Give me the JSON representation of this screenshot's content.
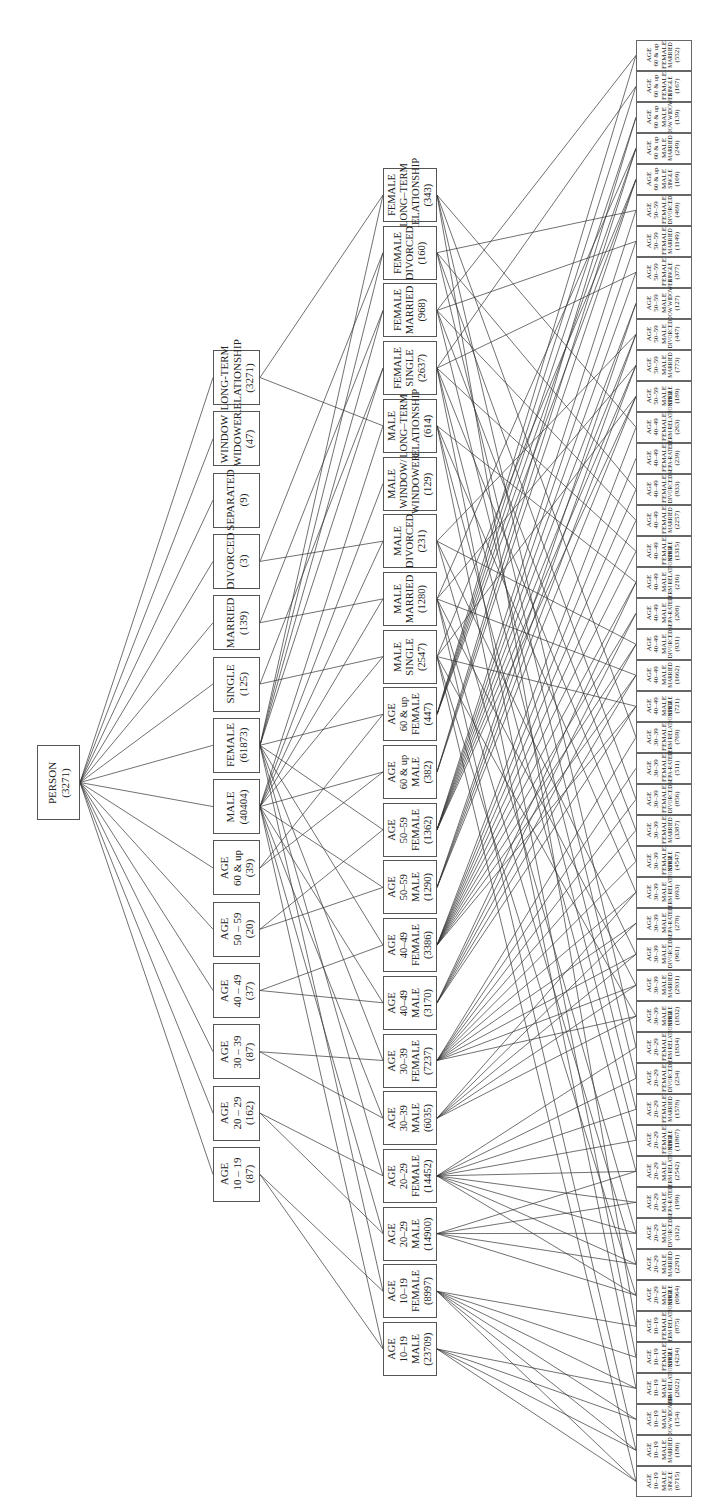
{
  "root": {
    "label": "PERSON",
    "count": "(3271)"
  },
  "level2": [
    {
      "lines": [
        "LONG-TERM",
        "RELATIONSHIP"
      ],
      "count": "(3271)"
    },
    {
      "lines": [
        "WINDOW",
        "WIDOWER"
      ],
      "count": "(47)"
    },
    {
      "lines": [
        "SEPARATED"
      ],
      "count": "(9)"
    },
    {
      "lines": [
        "DIVORCED"
      ],
      "count": "(3)"
    },
    {
      "lines": [
        "MARRIED"
      ],
      "count": "(139)"
    },
    {
      "lines": [
        "SINGLE"
      ],
      "count": "(125)"
    },
    {
      "lines": [
        "FEMALE"
      ],
      "count": "(61873)"
    },
    {
      "lines": [
        "MALE"
      ],
      "count": "(40404)"
    },
    {
      "lines": [
        "AGE",
        "60 & up"
      ],
      "count": "(39)"
    },
    {
      "lines": [
        "AGE",
        "50 – 59"
      ],
      "count": "(20)"
    },
    {
      "lines": [
        "AGE",
        "40 – 49"
      ],
      "count": "(37)"
    },
    {
      "lines": [
        "AGE",
        "30 – 39"
      ],
      "count": "(87)"
    },
    {
      "lines": [
        "AGE",
        "20 – 29"
      ],
      "count": "(162)"
    },
    {
      "lines": [
        "AGE",
        "10 – 19"
      ],
      "count": "(87)"
    }
  ],
  "level3": [
    {
      "lines": [
        "FEMALE",
        "LONG–TERM",
        "RELATIONSHIP"
      ],
      "count": "(343)"
    },
    {
      "lines": [
        "FEMALE",
        "DIVORCED"
      ],
      "count": "(160)"
    },
    {
      "lines": [
        "FEMALE",
        "MARRIED"
      ],
      "count": "(968)"
    },
    {
      "lines": [
        "FEMALE",
        "SINGLE"
      ],
      "count": "(2637)"
    },
    {
      "lines": [
        "MALE",
        "LONG–TERM",
        "RELATIONSHIP"
      ],
      "count": "(614)"
    },
    {
      "lines": [
        "MALE",
        "WINDOW/",
        "WINDOWER"
      ],
      "count": "(129)"
    },
    {
      "lines": [
        "MALE",
        "DIVORCED"
      ],
      "count": "(231)"
    },
    {
      "lines": [
        "MALE",
        "MARRIED"
      ],
      "count": "(1280)"
    },
    {
      "lines": [
        "MALE",
        "SINGLE"
      ],
      "count": "(2547)"
    },
    {
      "lines": [
        "AGE",
        "60 & up",
        "FEMALE"
      ],
      "count": "(447)"
    },
    {
      "lines": [
        "AGE",
        "60 & up",
        "MALE"
      ],
      "count": "(382)"
    },
    {
      "lines": [
        "AGE",
        "50–59",
        "FEMALE"
      ],
      "count": "(1362)"
    },
    {
      "lines": [
        "AGE",
        "50–59",
        "MALE"
      ],
      "count": "(1290)"
    },
    {
      "lines": [
        "AGE",
        "40–49",
        "FEMALE"
      ],
      "count": "(3386)"
    },
    {
      "lines": [
        "AGE",
        "40–49",
        "MALE"
      ],
      "count": "(3170)"
    },
    {
      "lines": [
        "AGE",
        "30–39",
        "FEMALE"
      ],
      "count": "(7237)"
    },
    {
      "lines": [
        "AGE",
        "30–39",
        "MALE"
      ],
      "count": "(6035)"
    },
    {
      "lines": [
        "AGE",
        "20–29",
        "FEMALE"
      ],
      "count": "(14452)"
    },
    {
      "lines": [
        "AGE",
        "20–29",
        "MALE"
      ],
      "count": "(14900)"
    },
    {
      "lines": [
        "AGE",
        "10–19",
        "FEMALE"
      ],
      "count": "(8997)"
    },
    {
      "lines": [
        "AGE",
        "10–19",
        "MALE"
      ],
      "count": "(23709)"
    }
  ],
  "leaves": [
    {
      "age": "60 & up",
      "sex": "FEMALE",
      "status": "MARRIED",
      "count": "(552)"
    },
    {
      "age": "60 & up",
      "sex": "FEMALE",
      "status": "SINGLE",
      "count": "(167)"
    },
    {
      "age": "60 & up",
      "sex": "MALE",
      "status": "WIDOW WIDOWER",
      "count": "(139)"
    },
    {
      "age": "60 & up",
      "sex": "MALE",
      "status": "MARRIED",
      "count": "(249)"
    },
    {
      "age": "60 & up",
      "sex": "MALE",
      "status": "SINGLE",
      "count": "(109)"
    },
    {
      "age": "50–59",
      "sex": "FEMALE",
      "status": "DIVORCED",
      "count": "(469)"
    },
    {
      "age": "50–59",
      "sex": "FEMALE",
      "status": "MARRIED",
      "count": "(1149)"
    },
    {
      "age": "50–59",
      "sex": "FEMALE",
      "status": "SINGLE",
      "count": "(377)"
    },
    {
      "age": "50–59",
      "sex": "MALE",
      "status": "WIDOW WIDOWER",
      "count": "(127)"
    },
    {
      "age": "50–59",
      "sex": "MALE",
      "status": "DIVORCED",
      "count": "(447)"
    },
    {
      "age": "50–59",
      "sex": "MALE",
      "status": "MARRIED",
      "count": "(773)"
    },
    {
      "age": "50–59",
      "sex": "MALE",
      "status": "SINGLE",
      "count": "(189)"
    },
    {
      "age": "40–49",
      "sex": "FEMALE",
      "status": "LONG-TERM RELATIONSHIP",
      "count": "(263)"
    },
    {
      "age": "40–49",
      "sex": "FEMALE",
      "status": "SEPA-RATED",
      "count": "(239)"
    },
    {
      "age": "40–49",
      "sex": "FEMALE",
      "status": "DIVORCED",
      "count": "(933)"
    },
    {
      "age": "40–49",
      "sex": "FEMALE",
      "status": "MARRIED",
      "count": "(2257)"
    },
    {
      "age": "40–49",
      "sex": "FEMALE",
      "status": "SINGLE",
      "count": "(1315)"
    },
    {
      "age": "40–49",
      "sex": "MALE",
      "status": "LONG-TERM RELATIONSHIP",
      "count": "(216)"
    },
    {
      "age": "40–49",
      "sex": "MALE",
      "status": "SEPA-RATED",
      "count": "(208)"
    },
    {
      "age": "40–49",
      "sex": "MALE",
      "status": "DIVORCED",
      "count": "(931)"
    },
    {
      "age": "40–49",
      "sex": "MALE",
      "status": "MARRIED",
      "count": "(1662)"
    },
    {
      "age": "40–49",
      "sex": "MALE",
      "status": "SINGLE",
      "count": "(721)"
    },
    {
      "age": "30–39",
      "sex": "FEMALE",
      "status": "LONG-TERM RELATIONSHIP",
      "count": "(769)"
    },
    {
      "age": "30–39",
      "sex": "FEMALE",
      "status": "SEPA-RATED",
      "count": "(511)"
    },
    {
      "age": "30–39",
      "sex": "FEMALE",
      "status": "DIVORCED",
      "count": "(856)"
    },
    {
      "age": "30–39",
      "sex": "FEMALE",
      "status": "MARRIED",
      "count": "(3387)"
    },
    {
      "age": "30–39",
      "sex": "FEMALE",
      "status": "SINGLE",
      "count": "(4547)"
    },
    {
      "age": "30–39",
      "sex": "MALE",
      "status": "LONG-TERM RELATIONSHIP",
      "count": "(693)"
    },
    {
      "age": "30–39",
      "sex": "MALE",
      "status": "SEPA-RATED",
      "count": "(278)"
    },
    {
      "age": "30–39",
      "sex": "MALE",
      "status": "DIVORCED",
      "count": "(961)"
    },
    {
      "age": "30–39",
      "sex": "MALE",
      "status": "MARRIED",
      "count": "(2931)"
    },
    {
      "age": "30–39",
      "sex": "MALE",
      "status": "SINGLE",
      "count": "(1832)"
    },
    {
      "age": "20–29",
      "sex": "FEMALE",
      "status": "LONG-TERM RELATIONSHIP",
      "count": "(1834)"
    },
    {
      "age": "20–29",
      "sex": "FEMALE",
      "status": "DIVORCED",
      "count": "(234)"
    },
    {
      "age": "20–29",
      "sex": "FEMALE",
      "status": "MARRIED",
      "count": "(1578)"
    },
    {
      "age": "20–29",
      "sex": "FEMALE",
      "status": "SINGLE",
      "count": "(11867)"
    },
    {
      "age": "20–29",
      "sex": "MALE",
      "status": "LONG-TERM RELATIONSHIP",
      "count": "(2542)"
    },
    {
      "age": "20–29",
      "sex": "MALE",
      "status": "SEPA-RATED",
      "count": "(199)"
    },
    {
      "age": "20–29",
      "sex": "MALE",
      "status": "DIVORCED",
      "count": "(312)"
    },
    {
      "age": "20–29",
      "sex": "MALE",
      "status": "MARRIED",
      "count": "(2291)"
    },
    {
      "age": "20–29",
      "sex": "MALE",
      "status": "SINGLE",
      "count": "(6964)"
    },
    {
      "age": "10–19",
      "sex": "FEMALE",
      "status": "LONG-TERM RELATIONSHIP",
      "count": "(875)"
    },
    {
      "age": "10–19",
      "sex": "FEMALE",
      "status": "SINGLE",
      "count": "(4234)"
    },
    {
      "age": "10–19",
      "sex": "MALE",
      "status": "LONG-TERM RELATIONSHIP",
      "count": "(2022)"
    },
    {
      "age": "10–19",
      "sex": "MALE",
      "status": "WIDOW WIDOWER",
      "count": "(154)"
    },
    {
      "age": "10–19",
      "sex": "MALE",
      "status": "MARRIED",
      "count": "(180)"
    },
    {
      "age": "10–19",
      "sex": "MALE",
      "status": "SINGLE",
      "count": "(6715)"
    }
  ],
  "leaf_prefix": "AGE"
}
